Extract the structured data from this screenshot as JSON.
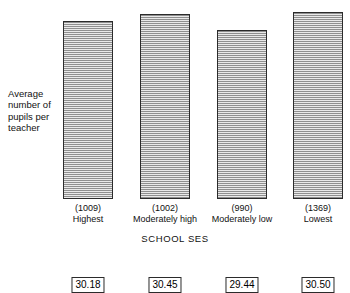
{
  "chart_data": {
    "type": "bar",
    "title": "",
    "xlabel": "SCHOOL SES",
    "ylabel": "Average number of pupils per teacher",
    "categories": [
      "Highest",
      "Moderately high",
      "Moderately low",
      "Lowest"
    ],
    "counts": [
      "(1009)",
      "(1002)",
      "(990)",
      "(1369)"
    ],
    "values": [
      30.18,
      30.45,
      29.44,
      30.5
    ],
    "value_labels": [
      "30.18",
      "30.45",
      "29.44",
      "30.50"
    ],
    "ylim": [
      29.0,
      30.62
    ],
    "y_axis_visible": false,
    "y_axis_starts_at_zero": false,
    "grid": false,
    "legend": null,
    "bar_fill": "#b4b4b4",
    "bar_hatch": "horizontal-lines",
    "bar_edge_color": "#2b2b2b",
    "background": "#ffffff"
  },
  "axis": {
    "y_caption_lines": "Average\nnumber of\npupils per\nteacher",
    "x_title": "SCHOOL  SES"
  },
  "bars": [
    {
      "count": "(1009)",
      "name": "Highest",
      "label": "30.18",
      "left": 63,
      "width": 50,
      "top": 21
    },
    {
      "count": "(1002)",
      "name": "Moderately high",
      "label": "30.45",
      "left": 140,
      "width": 50,
      "top": 14
    },
    {
      "count": "(990)",
      "name": "Moderately low",
      "label": "29.44",
      "left": 217,
      "width": 50,
      "top": 30
    },
    {
      "count": "(1369)",
      "name": "Lowest",
      "label": "30.50",
      "left": 293,
      "width": 50,
      "top": 12
    }
  ]
}
